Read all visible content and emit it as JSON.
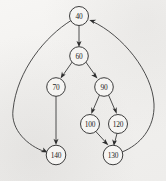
{
  "diagram": {
    "type": "directed-graph",
    "width": 166,
    "height": 181,
    "background_color": "#f3f2f0",
    "node_fill_color": "#f6f5f3",
    "node_stroke_color": "#333333",
    "edge_color": "#3a3a3a",
    "label_color": "#1d1d1d",
    "node_radius": 9.5,
    "nodes": [
      {
        "id": "n40",
        "label": "40",
        "cx": 79,
        "cy": 16,
        "r": 9.5
      },
      {
        "id": "n60",
        "label": "60",
        "cx": 79,
        "cy": 56,
        "r": 9.3
      },
      {
        "id": "n70",
        "label": "70",
        "cx": 56,
        "cy": 87,
        "r": 9.3
      },
      {
        "id": "n90",
        "label": "90",
        "cx": 104,
        "cy": 87,
        "r": 9.3
      },
      {
        "id": "n100",
        "label": "100",
        "cx": 90,
        "cy": 124,
        "r": 9.5
      },
      {
        "id": "n120",
        "label": "120",
        "cx": 118,
        "cy": 124,
        "r": 9.5
      },
      {
        "id": "n140",
        "label": "140",
        "cx": 56,
        "cy": 155,
        "r": 9.8
      },
      {
        "id": "n130",
        "label": "130",
        "cx": 113,
        "cy": 155,
        "r": 9.8
      }
    ],
    "edges": [
      {
        "from": "n40",
        "to": "n60",
        "from_label": "40",
        "to_label": "60",
        "shape": "straight"
      },
      {
        "from": "n40",
        "to": "n140",
        "from_label": "40",
        "to_label": "140",
        "shape": "curve-left"
      },
      {
        "from": "n60",
        "to": "n70",
        "from_label": "60",
        "to_label": "70",
        "shape": "straight"
      },
      {
        "from": "n60",
        "to": "n90",
        "from_label": "60",
        "to_label": "90",
        "shape": "straight"
      },
      {
        "from": "n70",
        "to": "n140",
        "from_label": "70",
        "to_label": "140",
        "shape": "straight"
      },
      {
        "from": "n90",
        "to": "n100",
        "from_label": "90",
        "to_label": "100",
        "shape": "straight"
      },
      {
        "from": "n90",
        "to": "n120",
        "from_label": "90",
        "to_label": "120",
        "shape": "straight"
      },
      {
        "from": "n100",
        "to": "n130",
        "from_label": "100",
        "to_label": "130",
        "shape": "straight"
      },
      {
        "from": "n120",
        "to": "n130",
        "from_label": "120",
        "to_label": "130",
        "shape": "straight"
      },
      {
        "from": "n130",
        "to": "n40",
        "from_label": "130",
        "to_label": "40",
        "shape": "curve-right"
      }
    ]
  }
}
